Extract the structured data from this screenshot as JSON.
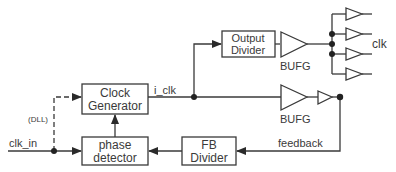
{
  "diagram": {
    "blocks": {
      "clock_generator": {
        "line1": "Clock",
        "line2": "Generator"
      },
      "phase_detector": {
        "line1": "phase",
        "line2": "detector"
      },
      "fb_divider": {
        "line1": "FB",
        "line2": "Divider"
      },
      "output_divider": {
        "line1": "Output",
        "line2": "Divider"
      }
    },
    "buffers": {
      "bufg_top": "BUFG",
      "bufg_mid": "BUFG"
    },
    "signals": {
      "clk_in": "clk_in",
      "i_clk": "i_clk",
      "feedback": "feedback",
      "clk": "clk",
      "dll": "(DLL)"
    },
    "colors": {
      "line": "#3a3a3a",
      "text": "#3a3a3a",
      "background": "#ffffff"
    }
  }
}
